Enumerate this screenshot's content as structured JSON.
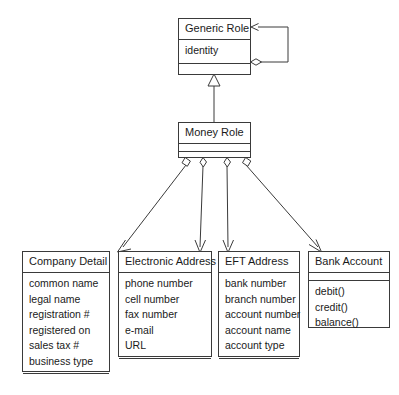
{
  "diagram": {
    "type": "uml-class-diagram",
    "stroke_color": "#3a3a3a",
    "text_color": "#1a1a1a",
    "background_color": "#ffffff",
    "classes": [
      {
        "id": "generic-role",
        "name": "Generic Role",
        "attributes": [
          "identity"
        ],
        "operations": [],
        "has_empty_third_compartment": true
      },
      {
        "id": "money-role",
        "name": "Money Role",
        "attributes": [],
        "operations": [],
        "has_empty_third_compartment": true
      },
      {
        "id": "company-detail",
        "name": "Company Detail",
        "attributes": [
          "common name",
          "legal name",
          "registration #",
          "registered on",
          "sales tax #",
          "business type"
        ],
        "operations": [],
        "has_empty_third_compartment": true
      },
      {
        "id": "electronic-address",
        "name": "Electronic Address",
        "attributes": [
          "phone number",
          "cell number",
          "fax number",
          "e-mail",
          "URL"
        ],
        "operations": [],
        "has_empty_third_compartment": true
      },
      {
        "id": "eft-address",
        "name": "EFT Address",
        "attributes": [
          "bank number",
          "branch number",
          "account number",
          "account name",
          "account type"
        ],
        "operations": [],
        "has_empty_third_compartment": true
      },
      {
        "id": "bank-account",
        "name": "Bank Account",
        "attributes": [],
        "operations": [
          "debit()",
          "credit()",
          "balance()"
        ],
        "has_empty_third_compartment": false
      }
    ],
    "relationships": [
      {
        "id": "generic-role-self-aggregation",
        "kind": "aggregation",
        "source": "generic-role",
        "target": "generic-role",
        "note": "reflexive aggregation loop with hollow diamond at source and open arrowhead at target"
      },
      {
        "id": "money-role-generalizes-generic-role",
        "kind": "generalization",
        "source": "money-role",
        "target": "generic-role",
        "note": "hollow triangle arrowhead at Generic Role"
      },
      {
        "id": "money-role-aggregates-company-detail",
        "kind": "aggregation",
        "source": "money-role",
        "target": "company-detail"
      },
      {
        "id": "money-role-aggregates-electronic-address",
        "kind": "aggregation",
        "source": "money-role",
        "target": "electronic-address"
      },
      {
        "id": "money-role-aggregates-eft-address",
        "kind": "aggregation",
        "source": "money-role",
        "target": "eft-address"
      },
      {
        "id": "money-role-aggregates-bank-account",
        "kind": "aggregation",
        "source": "money-role",
        "target": "bank-account"
      }
    ]
  }
}
